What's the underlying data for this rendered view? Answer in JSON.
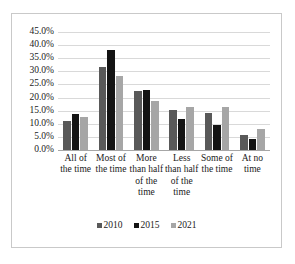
{
  "chart_data": {
    "type": "bar",
    "title": "",
    "subtitle": "",
    "xlabel": "",
    "ylabel": "",
    "ylim": [
      0,
      45
    ],
    "ytick_values": [
      0,
      5,
      10,
      15,
      20,
      25,
      30,
      35,
      40,
      45
    ],
    "ytick_labels": [
      "0.0%",
      "5.0%",
      "10.0%",
      "15.0%",
      "20.0%",
      "25.0%",
      "30.0%",
      "35.0%",
      "40.0%",
      "45.0%"
    ],
    "grid": true,
    "legend_position": "bottom",
    "categories": [
      "All of the time",
      "Most of the time",
      "More than half of the time",
      "Less than half of the time",
      "Some of the time",
      "At no time"
    ],
    "series": [
      {
        "name": "2010",
        "color": "#595959",
        "values": [
          11.0,
          31.6,
          22.4,
          15.1,
          14.3,
          5.6
        ]
      },
      {
        "name": "2015",
        "color": "#141414",
        "values": [
          13.8,
          38.2,
          22.9,
          11.8,
          9.6,
          4.2
        ]
      },
      {
        "name": "2021",
        "color": "#a6a6a6",
        "values": [
          12.5,
          28.4,
          18.7,
          16.3,
          16.5,
          7.9
        ]
      }
    ]
  },
  "axis": {
    "baseline_color": "#a6a6a6",
    "gridline_color": "#d9d9d9"
  },
  "frame": {
    "border_color": "#c9c9c9",
    "background": "#ffffff"
  }
}
